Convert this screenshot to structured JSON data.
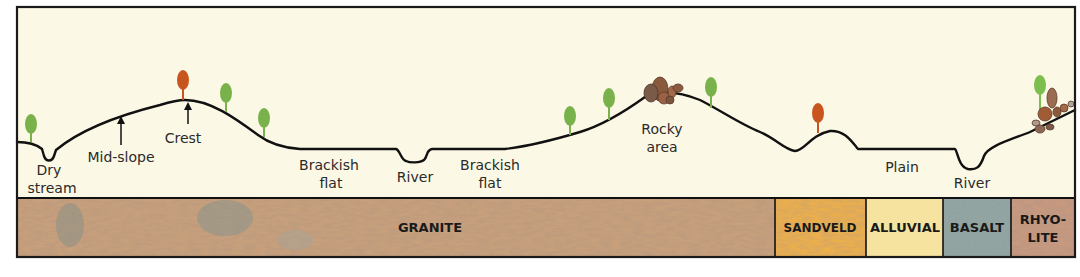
{
  "diagram": {
    "title": "",
    "colors": {
      "sky": "#fcf8e6",
      "frame": "#1a1a1a",
      "ground_line": "#111111",
      "tree_green": "#79b24a",
      "tree_red": "#c9551e",
      "rock": "#8a5a3c"
    },
    "landforms": [
      {
        "id": "dry-stream",
        "line1": "Dry",
        "line2": "stream"
      },
      {
        "id": "mid-slope",
        "line1": "Mid-slope"
      },
      {
        "id": "crest",
        "line1": "Crest"
      },
      {
        "id": "brackish-flat-1",
        "line1": "Brackish",
        "line2": "flat"
      },
      {
        "id": "river-1",
        "line1": "River"
      },
      {
        "id": "brackish-flat-2",
        "line1": "Brackish",
        "line2": "flat"
      },
      {
        "id": "rocky-area",
        "line1": "Rocky",
        "line2": "area"
      },
      {
        "id": "plain",
        "line1": "Plain"
      },
      {
        "id": "river-2",
        "line1": "River"
      }
    ],
    "geology": [
      {
        "id": "granite",
        "label": "GRANITE",
        "color": "#c9a07c"
      },
      {
        "id": "sandveld",
        "label": "SANDVELD",
        "color": "#edb04a"
      },
      {
        "id": "alluvial",
        "label": "ALLUVIAL",
        "color": "#f6e3a0"
      },
      {
        "id": "basalt",
        "label": "BASALT",
        "color": "#93a6a3"
      },
      {
        "id": "rhyolite",
        "label1": "RHYO-",
        "label2": "LITE",
        "color": "#c99a80"
      }
    ]
  }
}
